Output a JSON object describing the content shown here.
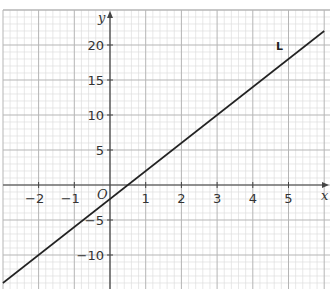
{
  "chart_data": {
    "type": "line",
    "title": "",
    "xlabel": "x",
    "ylabel": "y",
    "origin_label": "O",
    "xlim": [
      -3.05,
      6.2
    ],
    "ylim": [
      -14.5,
      25.0
    ],
    "x_ticks": [
      -2,
      -1,
      1,
      2,
      3,
      4,
      5
    ],
    "y_ticks": [
      -10,
      -5,
      5,
      10,
      15,
      20
    ],
    "grid": true,
    "minor_x_step": 0.2,
    "minor_y_step": 1,
    "series": [
      {
        "name": "L",
        "equation": "y = 4x - 2",
        "x": [
          -3,
          6
        ],
        "y": [
          -14,
          22
        ],
        "color": "#222222"
      }
    ],
    "annotations": [
      {
        "text": "L",
        "x": 4.6,
        "y": 19
      }
    ]
  }
}
